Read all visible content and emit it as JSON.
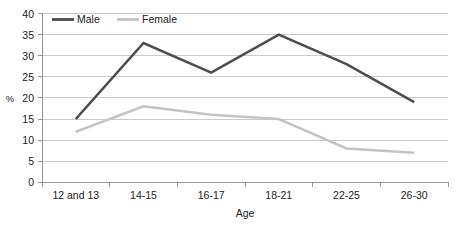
{
  "chart_data": {
    "type": "line",
    "title": "",
    "xlabel": "Age",
    "ylabel": "%",
    "categories": [
      "12 and 13",
      "14-15",
      "16-17",
      "18-21",
      "22-25",
      "26-30"
    ],
    "series": [
      {
        "name": "Male",
        "values": [
          15,
          33,
          26,
          35,
          28,
          19
        ],
        "color": "#4d4d4d"
      },
      {
        "name": "Female",
        "values": [
          12,
          18,
          16,
          15,
          8,
          7
        ],
        "color": "#c4c4c4"
      }
    ],
    "ylim": [
      0,
      40
    ],
    "yticks": [
      0,
      5,
      10,
      15,
      20,
      25,
      30,
      35,
      40
    ],
    "ytick_labels": [
      "0",
      "5",
      "10",
      "15",
      "20",
      "25",
      "30",
      "35",
      "40"
    ],
    "grid": true,
    "legend_position": "top-left",
    "legend": [
      "Male",
      "Female"
    ]
  },
  "colors": {
    "male": "#4d4d4d",
    "female": "#c4c4c4",
    "gridline": "#bfbfbf",
    "axis": "#8c8c8c",
    "text": "#222222",
    "background": "#ffffff"
  }
}
